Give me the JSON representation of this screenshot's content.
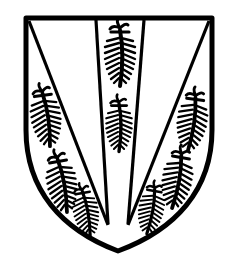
{
  "image": {
    "subject": "heraldic shield",
    "alt": "Black-and-white heraldic shield with a central pale and two diagonal divisions, charged with eight sprig-like figures",
    "colors": {
      "ink": "#000000",
      "field": "#ffffff"
    }
  },
  "shield": {
    "charges": [
      {
        "name": "center-upper",
        "x": 120,
        "y": 55,
        "scale": 1.0,
        "rotate": 0
      },
      {
        "name": "center-lower",
        "x": 120,
        "y": 125,
        "scale": 0.95,
        "rotate": 0
      },
      {
        "name": "left-upper",
        "x": 45,
        "y": 115,
        "scale": 0.95,
        "rotate": -8
      },
      {
        "name": "left-middle",
        "x": 62,
        "y": 180,
        "scale": 0.95,
        "rotate": -10
      },
      {
        "name": "left-lower",
        "x": 86,
        "y": 210,
        "scale": 0.85,
        "rotate": -10
      },
      {
        "name": "right-upper",
        "x": 192,
        "y": 120,
        "scale": 0.95,
        "rotate": 8
      },
      {
        "name": "right-middle",
        "x": 177,
        "y": 178,
        "scale": 0.95,
        "rotate": 10
      },
      {
        "name": "right-lower",
        "x": 150,
        "y": 210,
        "scale": 0.85,
        "rotate": 10
      }
    ]
  }
}
